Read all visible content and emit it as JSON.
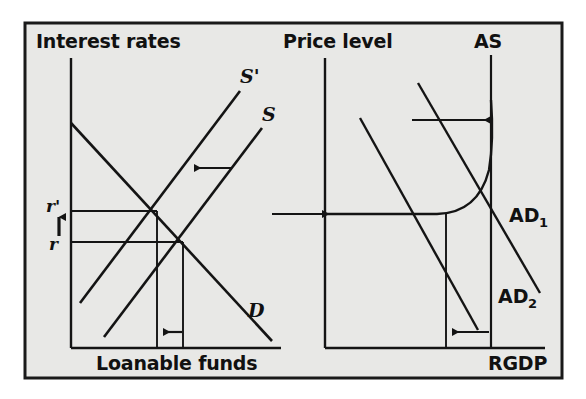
{
  "figure": {
    "background_color": "#e8e8e6",
    "frame_color": "#1a1a1a",
    "line_color": "#141414",
    "page_color": "#ffffff"
  },
  "left_panel": {
    "name": "loanable-funds-market",
    "y_axis_label": "Interest rates",
    "x_axis_label": "Loanable funds",
    "curves": [
      {
        "id": "s-prime",
        "label": "S'",
        "description": "shifted supply of loanable funds"
      },
      {
        "id": "s",
        "label": "S",
        "description": "original supply of loanable funds"
      },
      {
        "id": "d",
        "label": "D",
        "description": "demand for loanable funds"
      }
    ],
    "rate_labels": [
      {
        "id": "r-prime",
        "label": "r'",
        "description": "new higher interest rate"
      },
      {
        "id": "r",
        "label": "r",
        "description": "original interest rate"
      }
    ],
    "annotations": [
      {
        "id": "supply-shift-arrow",
        "direction": "left",
        "description": "supply curve shifts left"
      },
      {
        "id": "rate-rise-arrow",
        "direction": "up",
        "description": "interest rate rises from r to r'"
      },
      {
        "id": "quantity-fall-arrow",
        "direction": "left",
        "description": "quantity of loanable funds falls"
      }
    ]
  },
  "right_panel": {
    "name": "aggregate-demand-supply-market",
    "y_axis_label": "Price level",
    "x_axis_label": "RGDP",
    "curves": [
      {
        "id": "as",
        "label": "AS",
        "description": "aggregate supply"
      },
      {
        "id": "ad1",
        "label": "AD",
        "subscript": "1",
        "description": "original aggregate demand"
      },
      {
        "id": "ad2",
        "label": "AD",
        "subscript": "2",
        "description": "shifted aggregate demand"
      }
    ],
    "annotations": [
      {
        "id": "transmission-arrow",
        "direction": "right",
        "description": "effect carries over from loanable funds market"
      },
      {
        "id": "ad-shift-arrow",
        "direction": "left",
        "description": "aggregate demand shifts left"
      },
      {
        "id": "rgdp-fall-arrow",
        "direction": "left",
        "description": "real GDP falls"
      }
    ]
  }
}
